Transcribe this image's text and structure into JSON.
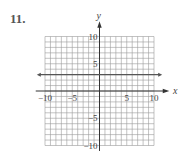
{
  "problem": {
    "number": "11."
  },
  "chart_data": {
    "type": "line",
    "title": "",
    "xlabel": "x",
    "ylabel": "y",
    "xlim": [
      -10,
      10
    ],
    "ylim": [
      -10,
      10
    ],
    "grid": true,
    "grid_step": 1,
    "x_ticks": [
      -10,
      -5,
      5,
      10
    ],
    "y_ticks": [
      10,
      5,
      -5,
      -10
    ],
    "x_tick_labels": [
      "−10",
      "−5",
      "5",
      "10"
    ],
    "y_tick_labels": [
      "10",
      "5",
      "−5",
      "−10"
    ],
    "series": [
      {
        "name": "horizontal line",
        "equation": "y = 3",
        "x": [
          -11.5,
          11.5
        ],
        "y": [
          3,
          3
        ],
        "arrows": "both"
      }
    ]
  },
  "colors": {
    "axis": "#333333",
    "grid": "#9a9a9a",
    "line": "#555555",
    "text": "#444444"
  }
}
